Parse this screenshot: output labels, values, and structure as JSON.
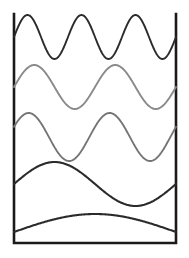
{
  "figure": {
    "background_color": "#ffffff",
    "frame": {
      "name": "wave-box-frame",
      "x": 14,
      "y": 14,
      "width": 162,
      "height": 229,
      "stroke_color": "#1a1a1a",
      "stroke_width": 2.6,
      "fill": "none",
      "left_edge_x": 14,
      "right_edge_x": 176,
      "top_edge_y": 14,
      "bottom_edge_y": 243,
      "top_side_drawn": false
    },
    "axis": {
      "x_range": [
        14,
        176
      ],
      "y_range": [
        14,
        243
      ],
      "grid": false,
      "tick_labels": [],
      "legend": "none"
    }
  },
  "chart_data": {
    "type": "line",
    "subtitle": "",
    "xlabel": "",
    "ylabel": "",
    "xlim": [
      14,
      176
    ],
    "ylim": [
      14,
      243
    ],
    "grid": false,
    "legend_position": "none",
    "x_span_px": 162,
    "series": [
      {
        "name": "harmonic-3-dark",
        "cycles": 3,
        "color": "#2b2b2b",
        "stroke_width": 1.9,
        "baseline_y": 37,
        "amplitude_px": 22,
        "phase_deg": 0,
        "peak_y": 15,
        "trough_y": 59,
        "start_y": 37,
        "end_y": 37,
        "order": 1
      },
      {
        "name": "harmonic-2-gray",
        "cycles": 2,
        "color": "#8a8a8a",
        "stroke_width": 1.9,
        "baseline_y": 87,
        "amplitude_px": 22,
        "phase_deg": 0,
        "peak_y": 65,
        "trough_y": 109,
        "start_y": 87,
        "end_y": 87,
        "order": 2
      },
      {
        "name": "harmonic-2-gray-shifted",
        "cycles": 2,
        "color": "#757575",
        "stroke_width": 1.9,
        "baseline_y": 137,
        "amplitude_px": 24,
        "phase_deg": 25,
        "peak_y": 113,
        "trough_y": 161,
        "start_y": 127,
        "end_y": 127,
        "order": 3
      },
      {
        "name": "harmonic-1-dark",
        "cycles": 1,
        "color": "#2b2b2b",
        "stroke_width": 2.1,
        "baseline_y": 184,
        "amplitude_px": 22,
        "phase_deg": 0,
        "peak_y": 162,
        "trough_y": 206,
        "start_y": 184,
        "end_y": 184,
        "order": 4
      },
      {
        "name": "harmonic-half-dark",
        "cycles": 0.5,
        "color": "#2b2b2b",
        "stroke_width": 2.1,
        "baseline_y": 232,
        "amplitude_px": 18,
        "phase_deg": 0,
        "peak_y": 214,
        "trough_y": 232,
        "start_y": 232,
        "end_y": 232,
        "order": 5
      }
    ]
  }
}
